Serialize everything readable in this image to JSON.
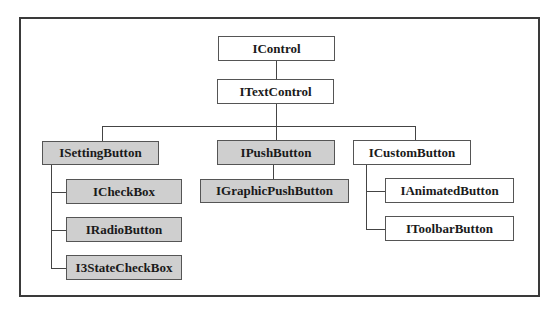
{
  "diagram": {
    "type": "class-hierarchy",
    "colors": {
      "base": "#ffffff",
      "highlighted": "#cfcfcf",
      "border": "#555555"
    },
    "nodes": {
      "icontrol": {
        "label": "IControl",
        "style": "white"
      },
      "itextcontrol": {
        "label": "ITextControl",
        "style": "white"
      },
      "isettingbutton": {
        "label": "ISettingButton",
        "style": "gray"
      },
      "ipushbutton": {
        "label": "IPushButton",
        "style": "gray"
      },
      "icustombutton": {
        "label": "ICustomButton",
        "style": "white"
      },
      "icheckbox": {
        "label": "ICheckBox",
        "style": "gray"
      },
      "iradiobutton": {
        "label": "IRadioButton",
        "style": "gray"
      },
      "i3statecheckbox": {
        "label": "I3StateCheckBox",
        "style": "gray"
      },
      "igraphicpushbutton": {
        "label": "IGraphicPushButton",
        "style": "gray"
      },
      "ianimatedbutton": {
        "label": "IAnimatedButton",
        "style": "white"
      },
      "itoolbarbutton": {
        "label": "IToolbarButton",
        "style": "white"
      }
    },
    "edges": [
      [
        "IControl",
        "ITextControl"
      ],
      [
        "ITextControl",
        "ISettingButton"
      ],
      [
        "ITextControl",
        "IPushButton"
      ],
      [
        "ITextControl",
        "ICustomButton"
      ],
      [
        "ISettingButton",
        "ICheckBox"
      ],
      [
        "ISettingButton",
        "IRadioButton"
      ],
      [
        "ISettingButton",
        "I3StateCheckBox"
      ],
      [
        "IPushButton",
        "IGraphicPushButton"
      ],
      [
        "ICustomButton",
        "IAnimatedButton"
      ],
      [
        "ICustomButton",
        "IToolbarButton"
      ]
    ]
  }
}
